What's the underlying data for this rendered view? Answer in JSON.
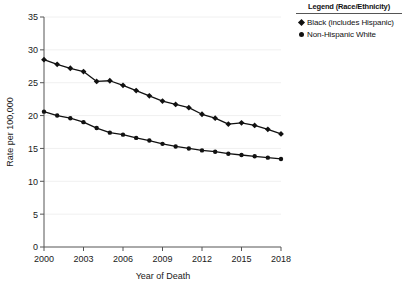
{
  "legend": {
    "title": "Legend (Race/Ethnicity)",
    "entries": [
      {
        "label": "Black (includes Hispanic)",
        "marker": "diamond"
      },
      {
        "label": "Non-Hispanic White",
        "marker": "circle"
      }
    ]
  },
  "axes": {
    "x_title": "Year of Death",
    "y_title": "Rate per 100,000",
    "x_tick_labels": [
      "2000",
      "2003",
      "2006",
      "2009",
      "2012",
      "2015",
      "2018"
    ],
    "y_tick_labels": [
      "0",
      "5",
      "10",
      "15",
      "20",
      "25",
      "30",
      "35"
    ]
  },
  "colors": {
    "series": "#111111",
    "axis": "#555555",
    "grid": "#f0f0f0",
    "text": "#1a1a1a"
  },
  "chart_data": {
    "type": "line",
    "title": "",
    "xlabel": "Year of Death",
    "ylabel": "Rate per 100,000",
    "xlim": [
      2000,
      2018
    ],
    "ylim": [
      0,
      35
    ],
    "grid": true,
    "legend_position": "top-right",
    "x": [
      2000,
      2001,
      2002,
      2003,
      2004,
      2005,
      2006,
      2007,
      2008,
      2009,
      2010,
      2011,
      2012,
      2013,
      2014,
      2015,
      2016,
      2017,
      2018
    ],
    "xticks": [
      2000,
      2003,
      2006,
      2009,
      2012,
      2015,
      2018
    ],
    "yticks": [
      0,
      5,
      10,
      15,
      20,
      25,
      30,
      35
    ],
    "series": [
      {
        "name": "Black (includes Hispanic)",
        "marker": "diamond",
        "values": [
          28.5,
          27.8,
          27.2,
          26.7,
          25.2,
          25.3,
          24.6,
          23.8,
          23.0,
          22.2,
          21.7,
          21.2,
          20.2,
          19.6,
          18.7,
          18.9,
          18.5,
          17.9,
          17.2
        ]
      },
      {
        "name": "Non-Hispanic White",
        "marker": "circle",
        "values": [
          20.6,
          20.0,
          19.6,
          19.0,
          18.1,
          17.4,
          17.1,
          16.6,
          16.2,
          15.7,
          15.3,
          15.0,
          14.7,
          14.5,
          14.2,
          14.0,
          13.8,
          13.6,
          13.4
        ]
      }
    ]
  }
}
